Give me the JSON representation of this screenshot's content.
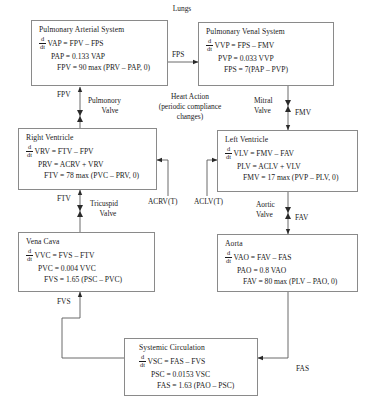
{
  "diagram": {
    "title_top": "Lungs",
    "nodes": [
      {
        "id": "pulmonary-arterial-system",
        "title": "Pulmonary Arterial System",
        "equations": [
          {
            "frac_num": "d",
            "frac_den": "dt",
            "text": "VAP = FPV – FPS"
          },
          {
            "text": "PAP = 0.133 VAP"
          },
          {
            "text": "FPV = 90 max (PRV – PAP, 0)"
          }
        ]
      },
      {
        "id": "pulmonary-venal-system",
        "title": "Pulmonary Venal System",
        "equations": [
          {
            "frac_num": "d",
            "frac_den": "dt",
            "text": "VVP = FPS – FMV"
          },
          {
            "text": "PVP = 0.033 VVP"
          },
          {
            "text": "FPS = 7(PAP – PVP)"
          }
        ]
      },
      {
        "id": "right-ventricle",
        "title": "Right Ventricle",
        "equations": [
          {
            "frac_num": "d",
            "frac_den": "dt",
            "text": "VRV = FTV – FPV"
          },
          {
            "text": "PRV = ACRV + VRV"
          },
          {
            "text": "FTV = 78 max (PVC – PRV, 0)"
          }
        ]
      },
      {
        "id": "left-ventricle",
        "title": "Left Ventricle",
        "equations": [
          {
            "frac_num": "d",
            "frac_den": "dt",
            "text": "VLV = FMV – FAV"
          },
          {
            "text": "PLV = ACLV + VLV"
          },
          {
            "text": "FMV = 17 max (PVP – PLV, 0)"
          }
        ]
      },
      {
        "id": "vena-cava",
        "title": "Vena Cava",
        "equations": [
          {
            "frac_num": "d",
            "frac_den": "dt",
            "text": "VVC = FVS – FTV"
          },
          {
            "text": "PVC = 0.004 VVC"
          },
          {
            "text": "FVS = 1.65 (PSC – PVC)"
          }
        ]
      },
      {
        "id": "aorta",
        "title": "Aorta",
        "equations": [
          {
            "frac_num": "d",
            "frac_den": "dt",
            "text": "VAO = FAV – FAS"
          },
          {
            "text": "PAO = 0.8 VAO"
          },
          {
            "text": "FAV = 80 max (PLV – PAO, 0)"
          }
        ]
      },
      {
        "id": "systemic-circulation",
        "title": "Systemic Circulation",
        "equations": [
          {
            "frac_num": "d",
            "frac_den": "dt",
            "text": "VSC = FAS – FVS"
          },
          {
            "text": "PSC = 0.0153 VSC"
          },
          {
            "text": "FAS = 1.63 (PAO – PSC)"
          }
        ]
      }
    ],
    "flow_labels": {
      "fps": "FPS",
      "fpv": "FPV",
      "fmv": "FMV",
      "ftv": "FTV",
      "fav": "FAV",
      "fvs": "FVS",
      "fas": "FAS",
      "acrv_t": "ACRV(T)",
      "aclv_t": "ACLV(T)"
    },
    "valve_labels": {
      "pulmonory_line1": "Pulmonory",
      "pulmonory_line2": "Valve",
      "mitral_line1": "Mitral",
      "mitral_line2": "Valve",
      "tricuspid_line1": "Tricuspid",
      "tricuspid_line2": "Valve",
      "aortic_line1": "Aortic",
      "aortic_line2": "Valve"
    },
    "heart_action": {
      "line1": "Heart Action",
      "line2": "(periodic compliance",
      "line3": "changes)"
    },
    "colors": {
      "stroke": "#8a8a8a",
      "text": "#1a1a1a",
      "background": "#ffffff"
    }
  }
}
